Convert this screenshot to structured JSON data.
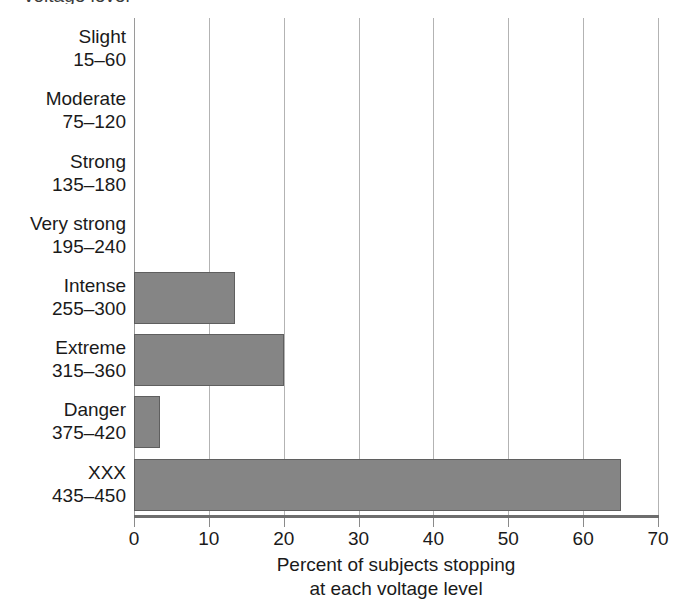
{
  "chart_data": {
    "type": "bar",
    "orientation": "horizontal",
    "title": "",
    "xlabel": "Percent of subjects stopping at each voltage level",
    "xlabel_lines": [
      "Percent of subjects stopping",
      "at each voltage level"
    ],
    "ylabel": "",
    "xlim": [
      0,
      70
    ],
    "xticks": [
      0,
      10,
      20,
      30,
      40,
      50,
      60,
      70
    ],
    "xtick_labels": [
      "0",
      "10",
      "20",
      "30",
      "40",
      "50",
      "60",
      "70"
    ],
    "grid": "vertical",
    "legend": "none",
    "bar_color": "#858585",
    "bar_edge_color": "#5f5f5f",
    "gridline_color": "#b3b3b3",
    "axis_color": "#6d6d6d",
    "categories": [
      "Slight 15–60",
      "Moderate 75–120",
      "Strong 135–180",
      "Very strong 195–240",
      "Intense 255–300",
      "Extreme 315–360",
      "Danger 375–420",
      "XXX 435–450"
    ],
    "category_names": [
      "Slight",
      "Moderate",
      "Strong",
      "Very strong",
      "Intense",
      "Extreme",
      "Danger",
      "XXX"
    ],
    "category_ranges": [
      "15–60",
      "75–120",
      "135–180",
      "195–240",
      "255–300",
      "315–360",
      "375–420",
      "435–450"
    ],
    "values": [
      0,
      0,
      0,
      0,
      13.5,
      20,
      3.5,
      65
    ]
  },
  "top_caption": {
    "text": "voltage level"
  }
}
